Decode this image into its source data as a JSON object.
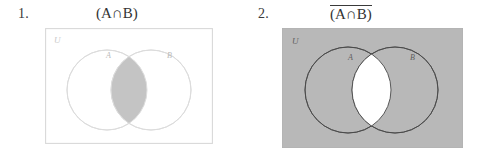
{
  "page": {
    "background_color": "#ffffff",
    "width": 481,
    "height": 165
  },
  "items": [
    {
      "number": "1.",
      "title": "(A∩B)",
      "title_has_overline": false,
      "description": "Venn diagram with the intersection of A and B shaded",
      "universe_label": "U",
      "set_a_label": "A",
      "set_b_label": "B",
      "rectangle_fill": "#ffffff",
      "rectangle_stroke": "#d9d9d9",
      "circle_fill": "#ffffff",
      "circle_stroke": "#dcdcdc",
      "shaded_region": "intersection",
      "shade_color": "#c4c4c4"
    },
    {
      "number": "2.",
      "title": "(A∩B)",
      "title_has_overline": true,
      "description": "Venn diagram with the complement of the intersection of A and B shaded",
      "universe_label": "U",
      "set_a_label": "A",
      "set_b_label": "B",
      "rectangle_fill": "#b8b8b8",
      "rectangle_stroke": "#b0b0b0",
      "circle_fill": "#b8b8b8",
      "circle_stroke": "#4a4a4a",
      "shaded_region": "complement-of-intersection",
      "shade_color": "#b8b8b8",
      "lens_color": "#ffffff"
    }
  ]
}
